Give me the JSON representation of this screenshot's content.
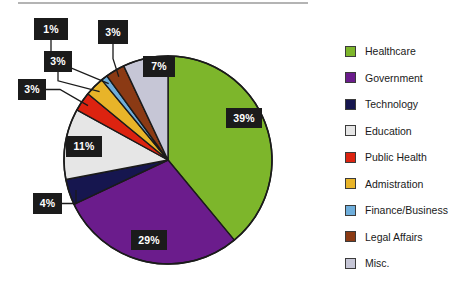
{
  "chart_data": {
    "type": "pie",
    "title": "",
    "categories": [
      "Healthcare",
      "Government",
      "Technology",
      "Education",
      "Public Health",
      "Admistration",
      "Finance/Business",
      "Legal Affairs",
      "Misc."
    ],
    "values": [
      39,
      29,
      4,
      11,
      3,
      3,
      1,
      3,
      7
    ],
    "value_labels": [
      "39%",
      "29%",
      "4%",
      "11%",
      "3%",
      "3%",
      "1%",
      "3%",
      "7%"
    ],
    "colors": [
      "#7DB62B",
      "#6B1C8C",
      "#16164F",
      "#E6E6E6",
      "#DC2310",
      "#E8B429",
      "#6FAEDB",
      "#8B3A14",
      "#C6C6D6"
    ],
    "units": "percent",
    "legend_position": "right",
    "start_angle_deg": 0,
    "direction": "clockwise",
    "label_style": "black-box-white-text",
    "grid": false,
    "xlabel": "",
    "ylabel": ""
  },
  "pie": {
    "center_x": 168,
    "center_y": 160,
    "radius": 104,
    "outline_color": "#1b1b1b",
    "slices": [
      {
        "name": "Healthcare",
        "label": "39%",
        "value": 39,
        "color": "#7DB62B",
        "label_x": 226,
        "label_y": 108,
        "label_w": 36,
        "label_h": 20,
        "callout": false
      },
      {
        "name": "Government",
        "label": "29%",
        "value": 29,
        "color": "#6B1C8C",
        "label_x": 131,
        "label_y": 230,
        "label_w": 36,
        "label_h": 20,
        "callout": false
      },
      {
        "name": "Technology",
        "label": "4%",
        "value": 4,
        "color": "#16164F",
        "label_x": 33,
        "label_y": 193,
        "label_w": 29,
        "label_h": 21,
        "callout": true
      },
      {
        "name": "Education",
        "label": "11%",
        "value": 11,
        "color": "#E6E6E6",
        "label_x": 66,
        "label_y": 136,
        "label_w": 36,
        "label_h": 21,
        "callout": false
      },
      {
        "name": "Public Health",
        "label": "3%",
        "value": 3,
        "color": "#DC2310",
        "label_x": 18,
        "label_y": 79,
        "label_w": 28,
        "label_h": 21,
        "callout": true
      },
      {
        "name": "Admistration",
        "label": "3%",
        "value": 3,
        "color": "#E8B429",
        "label_x": 44,
        "label_y": 51,
        "label_w": 28,
        "label_h": 21,
        "callout": true
      },
      {
        "name": "Finance/Business",
        "label": "1%",
        "value": 1,
        "color": "#6FAEDB",
        "label_x": 34,
        "label_y": 18,
        "label_w": 34,
        "label_h": 22,
        "callout": true
      },
      {
        "name": "Legal Affairs",
        "label": "3%",
        "value": 3,
        "color": "#8B3A14",
        "label_x": 98,
        "label_y": 20,
        "label_w": 30,
        "label_h": 24,
        "callout": true
      },
      {
        "name": "Misc.",
        "label": "7%",
        "value": 7,
        "color": "#C6C6D6",
        "label_x": 143,
        "label_y": 56,
        "label_w": 32,
        "label_h": 21,
        "callout": false
      }
    ]
  },
  "legend": {
    "items": [
      {
        "label": "Healthcare",
        "color": "#7DB62B"
      },
      {
        "label": "Government",
        "color": "#6B1C8C"
      },
      {
        "label": "Technology",
        "color": "#16164F"
      },
      {
        "label": "Education",
        "color": "#E6E6E6"
      },
      {
        "label": "Public Health",
        "color": "#DC2310"
      },
      {
        "label": "Admistration",
        "color": "#E8B429"
      },
      {
        "label": "Finance/Business",
        "color": "#6FAEDB"
      },
      {
        "label": "Legal Affairs",
        "color": "#8B3A14"
      },
      {
        "label": "Misc.",
        "color": "#C6C6D6"
      }
    ]
  }
}
